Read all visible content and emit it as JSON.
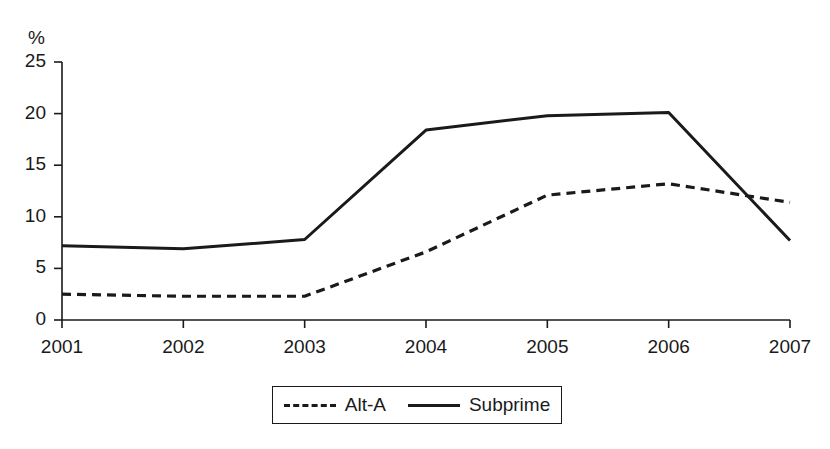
{
  "chart_data": {
    "type": "line",
    "title": "",
    "subtitle": "",
    "xlabel": "",
    "ylabel": "%",
    "y_unit_label": "%",
    "categories": [
      "2001",
      "2002",
      "2003",
      "2004",
      "2005",
      "2006",
      "2007"
    ],
    "x": [
      2001,
      2002,
      2003,
      2004,
      2005,
      2006,
      2007
    ],
    "xlim": [
      2001,
      2007
    ],
    "ylim": [
      0,
      25
    ],
    "yticks": [
      0,
      5,
      10,
      15,
      20,
      25
    ],
    "ytick_labels": [
      "0",
      "5",
      "10",
      "15",
      "20",
      "25"
    ],
    "xticks": [
      2001,
      2002,
      2003,
      2004,
      2005,
      2006,
      2007
    ],
    "xtick_labels": [
      "2001",
      "2002",
      "2003",
      "2004",
      "2005",
      "2006",
      "2007"
    ],
    "grid": false,
    "legend_position": "bottom-center",
    "series": [
      {
        "name": "Alt-A",
        "style": "dashed",
        "color": "#1a1a1a",
        "values": [
          2.5,
          2.3,
          2.3,
          6.6,
          12.1,
          13.2,
          11.4
        ]
      },
      {
        "name": "Subprime",
        "style": "solid",
        "color": "#1a1a1a",
        "values": [
          7.2,
          6.9,
          7.8,
          18.4,
          19.8,
          20.1,
          7.7
        ]
      }
    ]
  },
  "axis": {
    "unit_label": "%"
  },
  "legend": {
    "entries": [
      {
        "label": "Alt-A",
        "style": "dashed"
      },
      {
        "label": "Subprime",
        "style": "solid"
      }
    ]
  }
}
